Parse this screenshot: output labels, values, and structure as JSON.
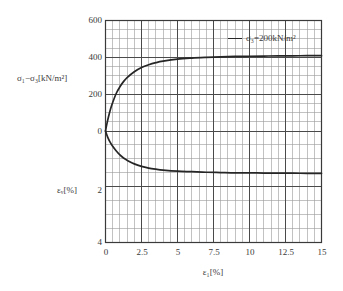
{
  "chart_data": {
    "type": "line",
    "title": "",
    "xlabel": "ε₁[%]",
    "ylabel_upper": "σ₁−σ₃[kN/m²]",
    "ylabel_lower": "εᵥ[%]",
    "xlim": [
      0,
      15
    ],
    "ylim_upper": [
      0,
      600
    ],
    "ylim_lower": [
      0,
      4
    ],
    "grid": true,
    "legend_position": "top-right",
    "x_ticks": [
      "0",
      "2.5",
      "5",
      "7.5",
      "10",
      "12.5",
      "15"
    ],
    "x_tick_values": [
      0,
      2.5,
      5,
      7.5,
      10,
      12.5,
      15
    ],
    "y_ticks_upper": [
      "600",
      "400",
      "200",
      "0"
    ],
    "y_tick_values_upper": [
      600,
      400,
      200,
      0
    ],
    "y_ticks_lower": [
      "0",
      "2",
      "4"
    ],
    "y_tick_values_lower": [
      0,
      2,
      4
    ],
    "series": [
      {
        "name": "σ₃=200kN/m² (deviator stress)",
        "axis": "upper",
        "color": "#262626",
        "x": [
          0,
          0.1,
          0.2,
          0.35,
          0.5,
          0.75,
          1.0,
          1.25,
          1.5,
          2.0,
          2.5,
          3.0,
          3.5,
          4.0,
          5.0,
          6.0,
          7.0,
          8.0,
          9.0,
          10.0,
          11.0,
          12.0,
          13.0,
          14.0,
          15.0
        ],
        "y": [
          0,
          40,
          75,
          120,
          155,
          205,
          240,
          268,
          290,
          322,
          345,
          360,
          371,
          379,
          390,
          396,
          400,
          403,
          405,
          406,
          407,
          408,
          408,
          409,
          409
        ]
      },
      {
        "name": "σ₃=200kN/m² (volumetric strain)",
        "axis": "lower",
        "color": "#262626",
        "x": [
          0,
          0.15,
          0.3,
          0.5,
          0.75,
          1.0,
          1.25,
          1.5,
          2.0,
          2.5,
          3.0,
          3.5,
          4.0,
          5.0,
          6.0,
          7.0,
          8.0,
          9.0,
          10.0,
          11.0,
          12.0,
          13.0,
          14.0,
          15.0
        ],
        "y": [
          0,
          0.22,
          0.38,
          0.55,
          0.72,
          0.86,
          0.97,
          1.05,
          1.18,
          1.27,
          1.33,
          1.37,
          1.4,
          1.44,
          1.46,
          1.48,
          1.49,
          1.5,
          1.5,
          1.51,
          1.51,
          1.51,
          1.52,
          1.52
        ]
      }
    ],
    "legend": [
      {
        "label": "σ₃=200kN/m²",
        "color": "#262626"
      }
    ]
  },
  "legend": {
    "entry_label": "σ₃=200kN/m²"
  },
  "axes": {
    "x_title": "ε₁[%]",
    "y_title_upper": "σ₁−σ₃[kN/m²]",
    "y_title_lower": "εᵥ[%]",
    "x_tick_0": "0",
    "x_tick_1": "2.5",
    "x_tick_2": "5",
    "x_tick_3": "7.5",
    "x_tick_4": "10",
    "x_tick_5": "12.5",
    "x_tick_6": "15",
    "y_tick_600": "600",
    "y_tick_400": "400",
    "y_tick_200": "200",
    "y_tick_0": "0",
    "y_tick_2": "2",
    "y_tick_4": "4"
  },
  "colors": {
    "curve": "#262626",
    "grid_minor": "#9a9a9a",
    "grid_major": "#4a4a4a",
    "frame": "#3a3a3a",
    "background": "#ffffff",
    "text": "#3a3a3a"
  }
}
